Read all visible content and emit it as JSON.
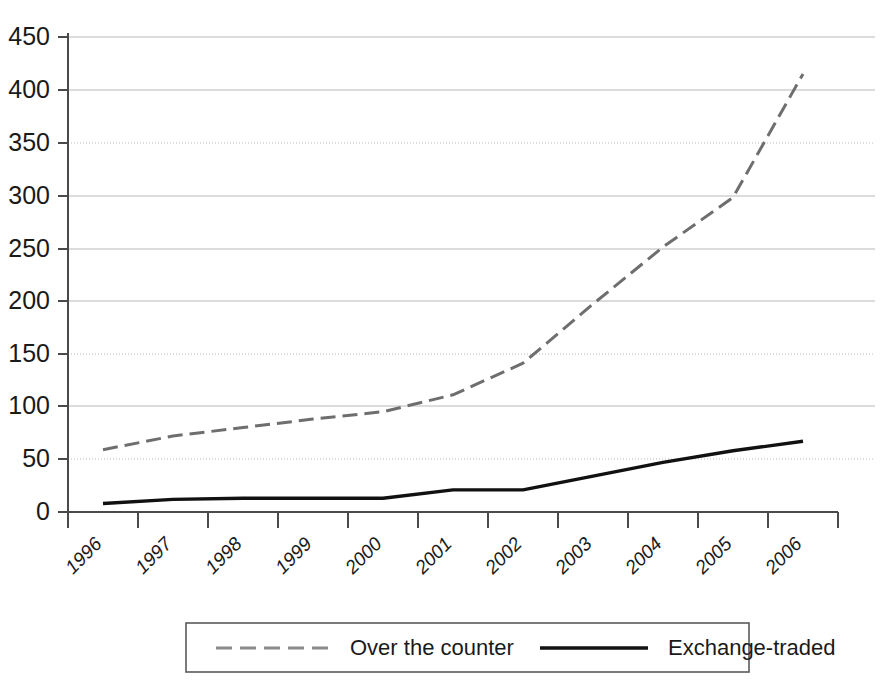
{
  "chart_data": {
    "type": "line",
    "title": "",
    "subtitle": "",
    "xlabel": "",
    "ylabel": "",
    "x": [
      "1996",
      "1997",
      "1998",
      "1999",
      "2000",
      "2001",
      "2002",
      "2003",
      "2004",
      "2005",
      "2006"
    ],
    "categories": [
      "1996",
      "1997",
      "1998",
      "1999",
      "2000",
      "2001",
      "2002",
      "2003",
      "2004",
      "2005",
      "2006"
    ],
    "ylim": [
      0,
      450
    ],
    "ytick_values": [
      0,
      50,
      100,
      150,
      200,
      250,
      300,
      350,
      400,
      450
    ],
    "ytick_labels": [
      "0",
      "50",
      "100",
      "150",
      "200",
      "250",
      "300",
      "350",
      "400",
      "450"
    ],
    "grid": true,
    "grid_axis": "y",
    "legend_position": "bottom",
    "series": [
      {
        "name": "Over the counter",
        "style": "dashed",
        "color": "#6e6e6e",
        "values": [
          59,
          72,
          80,
          88,
          95,
          111,
          141,
          197,
          251,
          298,
          415
        ]
      },
      {
        "name": "Exchange-traded",
        "style": "solid",
        "color": "#111111",
        "values": [
          8,
          12,
          13,
          13,
          13,
          21,
          21,
          34,
          47,
          58,
          67
        ]
      }
    ]
  },
  "axis": {
    "y_ticks": [
      "450",
      "400",
      "350",
      "300",
      "250",
      "200",
      "150",
      "100",
      "50",
      "0"
    ],
    "x_ticks": [
      "1996",
      "1997",
      "1998",
      "1999",
      "2000",
      "2001",
      "2002",
      "2003",
      "2004",
      "2005",
      "2006"
    ]
  },
  "legend": {
    "entries": [
      {
        "label": "Over the counter",
        "marker": "dashed-line-swatch"
      },
      {
        "label": "Exchange-traded",
        "marker": "solid-line-swatch"
      }
    ]
  }
}
